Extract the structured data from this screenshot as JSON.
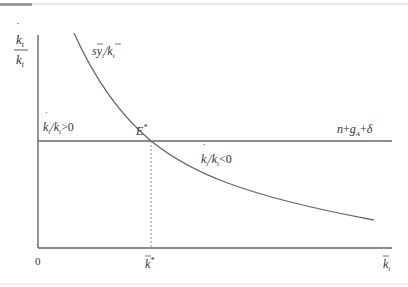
{
  "figure": {
    "y_axis_label": {
      "numerator": "k̇",
      "denominator": "k",
      "sub": "t"
    },
    "x_axis_label": {
      "base": "k",
      "sub": "t"
    },
    "origin_label": "0",
    "steady_state_x_label": {
      "base": "k",
      "sup": "*"
    },
    "equilibrium_label": {
      "base": "E",
      "sup": "*"
    },
    "curve_label": {
      "text": "sy",
      "sub": "t",
      "divider": "/",
      "denominator": "k",
      "denominator_sub": "t"
    },
    "line_label": {
      "parts": [
        "n",
        "+",
        "g",
        "A",
        "+",
        "δ"
      ]
    },
    "region_above_label": {
      "lhs": "k̇",
      "lhs_sub": "t",
      "divider": "/",
      "rhs": "k",
      "rhs_sub": "t",
      "relation": ">0"
    },
    "region_below_label": {
      "lhs": "k̇",
      "lhs_sub": "t",
      "divider": "/",
      "rhs": "k",
      "rhs_sub": "t",
      "relation": "<0"
    }
  },
  "colors": {
    "line": "#555555",
    "text": "#333333",
    "dashed": "#777777"
  }
}
